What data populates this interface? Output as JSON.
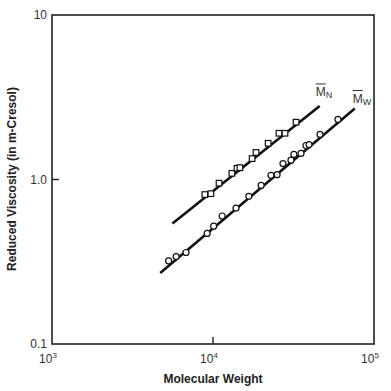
{
  "chart_data": {
    "type": "scatter",
    "title": "",
    "xlabel": "Molecular Weight",
    "ylabel": "Reduced Viscosity (in m-Cresol)",
    "xscale": "log",
    "yscale": "log",
    "xlim": [
      1000,
      100000
    ],
    "ylim": [
      0.1,
      10
    ],
    "x_ticks": [
      {
        "value": 1000,
        "base": "10",
        "exp": "3"
      },
      {
        "value": 10000,
        "base": "10",
        "exp": "4"
      },
      {
        "value": 100000,
        "base": "10",
        "exp": "5"
      }
    ],
    "y_ticks": [
      {
        "value": 10,
        "label": "10"
      },
      {
        "value": 1,
        "label": "1.0"
      },
      {
        "value": 0.1,
        "label": "0.1"
      }
    ],
    "grid": false,
    "legend": "inline labels at line ends",
    "series": [
      {
        "name": "M̄N",
        "label_main": "M",
        "label_sub": "N",
        "marker": "square",
        "fit_line": {
          "x": [
            5600,
            46000
          ],
          "y": [
            0.54,
            2.8
          ]
        },
        "x": [
          8900,
          9700,
          10900,
          13100,
          14100,
          14700,
          17500,
          18500,
          22000,
          25700,
          28000,
          32800
        ],
        "y": [
          0.81,
          0.82,
          0.95,
          1.09,
          1.17,
          1.18,
          1.34,
          1.46,
          1.66,
          1.91,
          1.91,
          2.23
        ]
      },
      {
        "name": "M̄W",
        "label_main": "M",
        "label_sub": "W",
        "marker": "circle",
        "fit_line": {
          "x": [
            4700,
            76000
          ],
          "y": [
            0.27,
            2.7
          ]
        },
        "x": [
          5300,
          5900,
          6800,
          9200,
          10100,
          11400,
          13900,
          16700,
          19900,
          22900,
          25000,
          27200,
          30500,
          31800,
          35200,
          37800,
          39500,
          46200,
          59700
        ],
        "y": [
          0.32,
          0.34,
          0.36,
          0.47,
          0.52,
          0.6,
          0.67,
          0.79,
          0.92,
          1.06,
          1.07,
          1.25,
          1.31,
          1.42,
          1.44,
          1.61,
          1.63,
          1.88,
          2.32
        ]
      }
    ]
  },
  "axis": {
    "x_title": "Molecular Weight",
    "y_title": "Reduced Viscosity (in m-Cresol)"
  }
}
